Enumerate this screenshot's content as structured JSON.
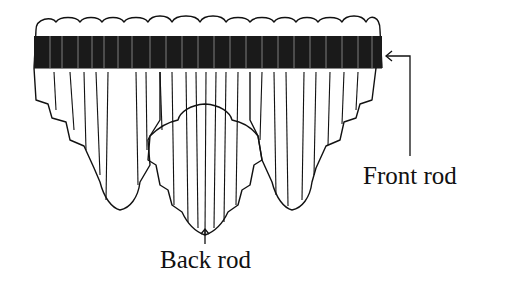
{
  "diagram": {
    "labels": {
      "front_rod": "Front rod",
      "back_rod": "Back rod"
    },
    "colors": {
      "line": "#111111",
      "background": "#ffffff"
    }
  }
}
